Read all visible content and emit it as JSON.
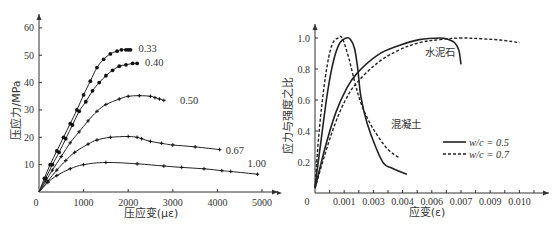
{
  "chart_data": [
    {
      "type": "line",
      "title": "",
      "xlabel": "压应变(με)",
      "ylabel": "压应力/MPa",
      "xlim": [
        0,
        5400
      ],
      "ylim": [
        0,
        62
      ],
      "x_ticks": [
        0,
        1000,
        2000,
        3000,
        4000,
        5000
      ],
      "y_ticks": [
        10,
        20,
        30,
        40,
        50,
        60
      ],
      "x_tick_labels": [
        "0",
        "1000",
        "2000",
        "3000",
        "4000",
        "5000"
      ],
      "y_tick_labels": [
        "10",
        "20",
        "30",
        "40",
        "50",
        "60"
      ],
      "grid": false,
      "legend": "inline labels at curve ends",
      "series": [
        {
          "name": "0.33",
          "marker": "circle",
          "x": [
            0,
            120,
            250,
            400,
            550,
            700,
            850,
            1000,
            1150,
            1300,
            1450,
            1600,
            1750,
            1850,
            1950,
            2000,
            2050
          ],
          "y": [
            0,
            5,
            10,
            15,
            20,
            25,
            30,
            35.5,
            40.5,
            45.5,
            48.5,
            50.5,
            51.5,
            52,
            52,
            52,
            52
          ]
        },
        {
          "name": "0.40",
          "marker": "circle",
          "x": [
            0,
            150,
            300,
            450,
            600,
            750,
            900,
            1050,
            1200,
            1350,
            1500,
            1650,
            1800,
            1950,
            2100,
            2200
          ],
          "y": [
            0,
            5,
            10,
            14.5,
            19.5,
            24.5,
            29.5,
            33,
            37,
            40,
            42.5,
            44.5,
            46,
            46.5,
            47,
            47
          ]
        },
        {
          "name": "0.50",
          "marker": "plus",
          "x": [
            0,
            150,
            300,
            500,
            700,
            900,
            1100,
            1300,
            1500,
            1800,
            2000,
            2250,
            2500,
            2600,
            2700,
            2800
          ],
          "y": [
            0,
            4,
            8,
            13,
            18,
            22,
            26,
            29.5,
            32,
            34,
            35,
            35.2,
            35,
            34.5,
            34,
            33.5
          ]
        },
        {
          "name": "0.67",
          "marker": "plus",
          "x": [
            0,
            200,
            400,
            600,
            800,
            1100,
            1300,
            1600,
            2000,
            2200,
            2300,
            2500,
            2750,
            3000,
            3500,
            4050
          ],
          "y": [
            0,
            4,
            8,
            11.5,
            14.5,
            17.5,
            19,
            20,
            20.3,
            20,
            19.5,
            18.5,
            17.8,
            17.2,
            16.5,
            15.5
          ]
        },
        {
          "name": "1.00",
          "marker": "plus",
          "x": [
            0,
            200,
            400,
            700,
            1000,
            1500,
            2200,
            2800,
            3200,
            3700,
            4100,
            4300,
            4900
          ],
          "y": [
            0,
            3.5,
            6,
            8.5,
            10,
            10.8,
            10.3,
            9.5,
            9,
            8.5,
            7.8,
            7.5,
            6.5
          ]
        }
      ]
    },
    {
      "type": "line",
      "title": "",
      "xlabel": "应变(ε)",
      "ylabel": "应力与强度之比",
      "xlim": [
        0,
        0.0107
      ],
      "ylim": [
        0,
        1.05
      ],
      "x_tick_labels": [
        "0",
        "0.001",
        "0.003",
        "0.004",
        "0.006",
        "0.007",
        "0.009",
        "0.010"
      ],
      "y_ticks": [
        0.2,
        0.4,
        0.6,
        0.8,
        1.0
      ],
      "y_tick_labels": [
        "0.2",
        "0.4",
        "0.6",
        "0.8",
        "1.0"
      ],
      "grid": false,
      "legend": {
        "position": "lower right",
        "entries": [
          {
            "label": "w/c = 0.5",
            "style": "solid"
          },
          {
            "label": "w/c = 0.7",
            "style": "dashed"
          }
        ]
      },
      "annotations": [
        "水泥石",
        "混凝土"
      ],
      "series": [
        {
          "name": "混凝土 w/c = 0.5",
          "style": "solid",
          "x": [
            0,
            0.0003,
            0.0006,
            0.0009,
            0.0012,
            0.0015,
            0.0017,
            0.0019,
            0.00205,
            0.0022,
            0.0025,
            0.0029,
            0.0033,
            0.0037,
            0.0044
          ],
          "y": [
            0.04,
            0.35,
            0.65,
            0.86,
            0.97,
            1.0,
            0.99,
            0.93,
            0.8,
            0.62,
            0.45,
            0.3,
            0.19,
            0.16,
            0.12
          ]
        },
        {
          "name": "混凝土 w/c = 0.7",
          "style": "dashed",
          "x": [
            0,
            0.0002,
            0.0005,
            0.0008,
            0.0011,
            0.0013,
            0.0016,
            0.0019,
            0.0022,
            0.0026,
            0.003,
            0.0035,
            0.004
          ],
          "y": [
            0.04,
            0.4,
            0.75,
            0.95,
            1.0,
            1.0,
            0.88,
            0.72,
            0.58,
            0.46,
            0.37,
            0.28,
            0.23
          ]
        },
        {
          "name": "水泥石 w/c = 0.5",
          "style": "solid",
          "x": [
            0,
            0.0005,
            0.001,
            0.0015,
            0.002,
            0.003,
            0.004,
            0.005,
            0.006,
            0.0064,
            0.0067,
            0.0069,
            0.007
          ],
          "y": [
            0.03,
            0.3,
            0.52,
            0.67,
            0.77,
            0.89,
            0.95,
            0.99,
            1.0,
            0.99,
            0.97,
            0.92,
            0.83
          ]
        },
        {
          "name": "水泥石 w/c = 0.7",
          "style": "dashed",
          "x": [
            0,
            0.0005,
            0.001,
            0.0015,
            0.002,
            0.003,
            0.004,
            0.005,
            0.006,
            0.007,
            0.008,
            0.009,
            0.0098
          ],
          "y": [
            0.03,
            0.26,
            0.46,
            0.61,
            0.71,
            0.84,
            0.92,
            0.97,
            0.99,
            1.0,
            0.995,
            0.985,
            0.97
          ]
        }
      ]
    }
  ],
  "left": {
    "ylabel": "压应力/MPa",
    "xlabel": "压应变(με)",
    "origin_label": "0",
    "curve_labels": [
      "0.33",
      "0.40",
      "0.50",
      "0.67",
      "1.00"
    ]
  },
  "right": {
    "ylabel": "应力与强度之比",
    "xlabel": "应变(ε)",
    "origin_label": "0",
    "annotation_cement": "水泥石",
    "annotation_concrete": "混凝土",
    "legend_solid": "w/c = 0.5",
    "legend_dashed": "w/c = 0.7"
  }
}
